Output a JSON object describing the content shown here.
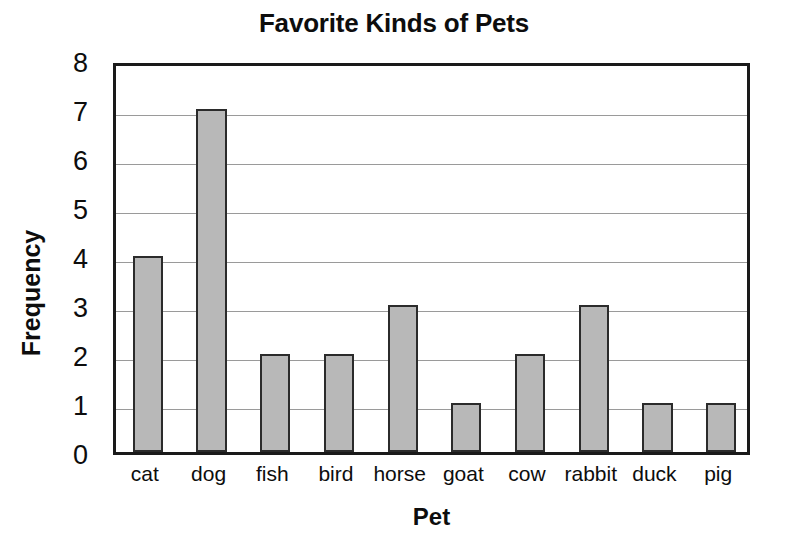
{
  "chart_data": {
    "type": "bar",
    "title": "Favorite Kinds of Pets",
    "xlabel": "Pet",
    "ylabel": "Frequency",
    "categories": [
      "cat",
      "dog",
      "fish",
      "bird",
      "horse",
      "goat",
      "cow",
      "rabbit",
      "duck",
      "pig"
    ],
    "values": [
      4,
      7,
      2,
      2,
      3,
      1,
      2,
      3,
      1,
      1
    ],
    "ylim": [
      0,
      8
    ],
    "ytick_labels": [
      "0",
      "1",
      "2",
      "3",
      "4",
      "5",
      "6",
      "7",
      "8"
    ],
    "ytick_values": [
      0,
      1,
      2,
      3,
      4,
      5,
      6,
      7,
      8
    ],
    "grid": true,
    "grid_axis": "y",
    "legend": false,
    "bar_color": "#b8b8b8",
    "bar_edge_color": "#2b2b2b",
    "grid_color": "#9a9a9a",
    "frame_color": "#1a1a1a",
    "background_color": "#ffffff"
  }
}
